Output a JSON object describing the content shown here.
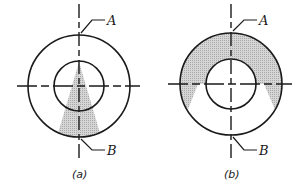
{
  "figures": [
    {
      "id": "a",
      "caption": "(a)",
      "point_top": "A",
      "point_bottom": "B",
      "shading": "triangular wedge from center down to outer circle"
    },
    {
      "id": "b",
      "caption": "(b)",
      "point_top": "A",
      "point_bottom": "B",
      "shading": "upper half of ring extending below horizontal axis"
    }
  ],
  "colors": {
    "line": "#1a1a1a",
    "shade": "#c8c8c8"
  }
}
